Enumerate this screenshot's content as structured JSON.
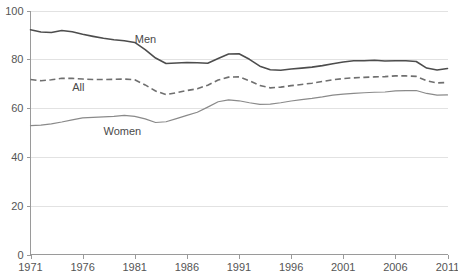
{
  "chart_data": {
    "type": "line",
    "title": "",
    "subtitle": "",
    "xlabel": "",
    "ylabel": "",
    "xlim": [
      1971,
      2011
    ],
    "ylim": [
      0,
      100
    ],
    "grid": true,
    "grid_axis": "y",
    "legend_position": "inline-labels",
    "y_ticks": [
      0,
      20,
      40,
      60,
      80,
      100
    ],
    "x_ticks": [
      1971,
      1976,
      1981,
      1986,
      1991,
      1996,
      2001,
      2006,
      2011
    ],
    "x": [
      1971,
      1972,
      1973,
      1974,
      1975,
      1976,
      1977,
      1978,
      1979,
      1980,
      1981,
      1982,
      1983,
      1984,
      1985,
      1986,
      1987,
      1988,
      1989,
      1990,
      1991,
      1992,
      1993,
      1994,
      1995,
      1996,
      1997,
      1998,
      1999,
      2000,
      2001,
      2002,
      2003,
      2004,
      2005,
      2006,
      2007,
      2008,
      2009,
      2010,
      2011
    ],
    "series": [
      {
        "name": "Men",
        "color": "#4d4d4d",
        "style": "solid",
        "label_text": "Men",
        "values": [
          92.1,
          91.2,
          91.0,
          91.8,
          91.3,
          90.3,
          89.4,
          88.6,
          88.0,
          87.6,
          86.9,
          84.0,
          80.5,
          78.3,
          78.5,
          78.7,
          78.6,
          78.4,
          80.3,
          82.2,
          82.3,
          80.0,
          77.2,
          75.7,
          75.5,
          76.0,
          76.4,
          76.8,
          77.4,
          78.2,
          78.9,
          79.4,
          79.4,
          79.6,
          79.3,
          79.4,
          79.4,
          79.1,
          76.4,
          75.6,
          76.2
        ]
      },
      {
        "name": "All",
        "color": "#6f6f6f",
        "style": "dashed",
        "label_text": "All",
        "values": [
          71.7,
          71.2,
          71.6,
          72.2,
          72.2,
          71.9,
          71.7,
          71.7,
          71.8,
          71.9,
          71.6,
          69.5,
          67.0,
          65.5,
          66.3,
          67.2,
          67.9,
          69.4,
          71.5,
          72.7,
          72.8,
          71.2,
          69.3,
          68.3,
          68.6,
          69.2,
          69.7,
          70.2,
          70.9,
          71.6,
          72.1,
          72.4,
          72.6,
          72.8,
          72.9,
          73.2,
          73.2,
          73.0,
          71.2,
          70.3,
          70.5
        ]
      },
      {
        "name": "Women",
        "color": "#8a8a8a",
        "style": "solid",
        "label_text": "Women",
        "values": [
          52.8,
          53.0,
          53.5,
          54.3,
          55.2,
          56.0,
          56.2,
          56.4,
          56.6,
          57.0,
          56.6,
          55.6,
          54.1,
          54.4,
          55.7,
          57.0,
          58.3,
          60.4,
          62.6,
          63.4,
          63.0,
          62.2,
          61.5,
          61.6,
          62.2,
          62.9,
          63.5,
          64.0,
          64.6,
          65.3,
          65.7,
          66.0,
          66.3,
          66.5,
          66.6,
          67.1,
          67.2,
          67.2,
          66.0,
          65.3,
          65.4
        ]
      }
    ],
    "annotations": [
      {
        "text": "Men",
        "x": 1981.0,
        "y": 86.5
      },
      {
        "text": "All",
        "x": 1975.0,
        "y": 67.0
      },
      {
        "text": "Women",
        "x": 1978.0,
        "y": 49.0
      }
    ]
  }
}
